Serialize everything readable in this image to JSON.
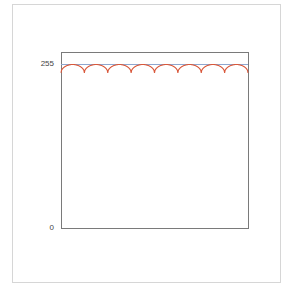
{
  "chart_data": {
    "type": "line",
    "title": "",
    "xlabel": "",
    "ylabel": "",
    "ylim": [
      0,
      280
    ],
    "yticks": [
      {
        "value": 0,
        "label": "0"
      },
      {
        "value": 255,
        "label": "255"
      }
    ],
    "grid": false,
    "legend": null,
    "series": [
      {
        "name": "reference-255",
        "color": "#8fa7cf",
        "type": "constant",
        "value": 255
      },
      {
        "name": "periodic-curve",
        "color": "#d9583b",
        "type": "line",
        "description": "Scalloped curve of repeated arches peaking at 255 with ~8 cusps dipping to ~242",
        "x": [
          0,
          0.5,
          1,
          1.5,
          2,
          2.5,
          3,
          3.5,
          4,
          4.5,
          5,
          5.5,
          6,
          6.5,
          7,
          7.5,
          8
        ],
        "values": [
          242,
          255,
          242,
          255,
          242,
          255,
          242,
          255,
          242,
          255,
          242,
          255,
          242,
          255,
          242,
          255,
          242
        ]
      }
    ]
  },
  "axis": {
    "y_top_label": "255",
    "y_bottom_label": "0"
  }
}
